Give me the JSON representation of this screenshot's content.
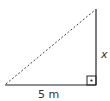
{
  "diagram": {
    "type": "right-triangle",
    "labels": {
      "base": "5 m",
      "height": "x"
    },
    "right_angle_marker": true,
    "hypotenuse_style": "dashed",
    "colors": {
      "stroke": "#222222",
      "background": "#ffffff"
    }
  }
}
